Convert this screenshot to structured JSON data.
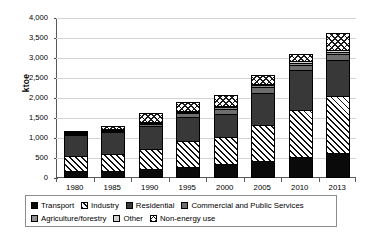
{
  "chart_data": {
    "type": "bar",
    "stacked": true,
    "title": "",
    "xlabel": "",
    "ylabel": "ktoe",
    "ylim": [
      0,
      4000
    ],
    "yticks": [
      "0",
      "500",
      "1,000",
      "1,500",
      "2,000",
      "2,500",
      "3,000",
      "3,500",
      "4,000"
    ],
    "ytick_values": [
      0,
      500,
      1000,
      1500,
      2000,
      2500,
      3000,
      3500,
      4000
    ],
    "grid": true,
    "legend_position": "bottom",
    "categories": [
      "1980",
      "1985",
      "1990",
      "1995",
      "2000",
      "2005",
      "2010",
      "2013"
    ],
    "series": [
      {
        "name": "Transport",
        "fill": "solid-black",
        "values": [
          120,
          135,
          175,
          235,
          300,
          375,
          480,
          575
        ]
      },
      {
        "name": "Industry",
        "fill": "diagonal-hatch",
        "values": [
          380,
          425,
          510,
          650,
          675,
          905,
          1165,
          1430
        ]
      },
      {
        "name": "Residential",
        "fill": "dark-gray",
        "values": [
          520,
          540,
          560,
          590,
          575,
          790,
          1010,
          895
        ]
      },
      {
        "name": "Commercial and Public Services",
        "fill": "medium-gray",
        "values": [
          25,
          30,
          50,
          90,
          135,
          150,
          120,
          150
        ]
      },
      {
        "name": "Agriculture/forestry",
        "fill": "gray",
        "values": [
          15,
          20,
          25,
          35,
          40,
          45,
          50,
          55
        ]
      },
      {
        "name": "Other",
        "fill": "light-gray",
        "values": [
          10,
          15,
          20,
          25,
          30,
          35,
          40,
          45
        ]
      },
      {
        "name": "Non-energy use",
        "fill": "cross-hatch",
        "values": [
          40,
          70,
          220,
          225,
          265,
          215,
          195,
          425
        ]
      }
    ],
    "totals": [
      1110,
      1235,
      1560,
      1850,
      2020,
      2515,
      3060,
      3575
    ]
  },
  "legend": {
    "rows": [
      [
        {
          "label": "Transport",
          "fill": "solid-black"
        },
        {
          "label": "Industry",
          "fill": "diagonal-hatch"
        },
        {
          "label": "Residential",
          "fill": "dark-gray"
        },
        {
          "label": "Commercial and Public Services",
          "fill": "medium-gray"
        }
      ],
      [
        {
          "label": "Agriculture/forestry",
          "fill": "gray"
        },
        {
          "label": "Other",
          "fill": "light-gray"
        },
        {
          "label": "Non-energy use",
          "fill": "cross-hatch"
        }
      ]
    ]
  },
  "colors": {
    "transport": "#0a0a0a",
    "residential": "#383838",
    "commercial": "#6e6e6e",
    "agriculture": "#8f8f8f",
    "other": "#d2d2d2",
    "gridline": "#d4d4d4",
    "axis": "#5a5a5a",
    "background": "#ffffff"
  }
}
